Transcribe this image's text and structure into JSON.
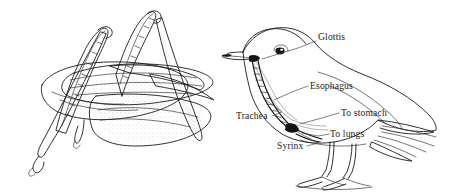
{
  "figure": {
    "background_color": "#ffffff",
    "ink_color": "#1a1a1a",
    "width": 449,
    "height": 193
  },
  "panels": [
    {
      "id": "grasshopper",
      "name": "grasshopper-illustration",
      "subject": "grasshopper",
      "description": "Line drawing of a grasshopper with two raised hind legs and layered stippled wings",
      "labels": []
    },
    {
      "id": "bird",
      "name": "bird-anatomy-illustration",
      "subject": "bird",
      "description": "Line drawing of a perching bird in side view with internal trachea and esophagus shown",
      "labels": [
        {
          "id": "glottis",
          "text": "Glottis",
          "x": 318,
          "y": 40,
          "anchor": "start"
        },
        {
          "id": "esophagus",
          "text": "Esophagus",
          "x": 310,
          "y": 89,
          "anchor": "start"
        },
        {
          "id": "trachea",
          "text": "Trachea",
          "x": 236,
          "y": 119,
          "anchor": "start"
        },
        {
          "id": "to_stomach",
          "text": "To stomach",
          "x": 341,
          "y": 116,
          "anchor": "start"
        },
        {
          "id": "to_lungs",
          "text": "To lungs",
          "x": 330,
          "y": 137,
          "anchor": "start"
        },
        {
          "id": "syrinx",
          "text": "Syrinx",
          "x": 277,
          "y": 149,
          "anchor": "start"
        }
      ]
    }
  ]
}
